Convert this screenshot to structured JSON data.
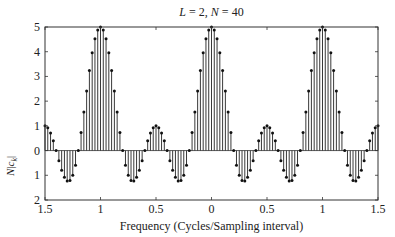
{
  "chart_data": {
    "type": "stem",
    "title": "L = 2, N = 40",
    "title_parts": {
      "L": "L",
      "L_val": "2",
      "N": "N",
      "N_val": "40"
    },
    "xlabel": "Frequency (Cycles/Sampling interval)",
    "ylabel": "N|c_k|",
    "xlim": [
      -1.5,
      1.5
    ],
    "ylim": [
      -2,
      5
    ],
    "x_tick_values": [
      -1.5,
      -1,
      -0.5,
      0,
      0.5,
      1,
      1.5
    ],
    "x_tick_labels": [
      "1.5",
      "1",
      "0.5",
      "0",
      "0.5",
      "1",
      "1.5"
    ],
    "y_tick_values": [
      5,
      4,
      3,
      2,
      1,
      0,
      -1,
      -2
    ],
    "y_tick_labels": [
      "5",
      "4",
      "3",
      "2",
      "1",
      "0",
      "1",
      "2"
    ],
    "grid": false,
    "legend": null,
    "x_step": 0.025,
    "x_start": -1.5,
    "values": [
      1.0,
      0.927,
      0.716,
      0.394,
      0,
      -0.414,
      -0.794,
      -1.084,
      -1.236,
      -1.215,
      -1.0,
      -0.589,
      0,
      0.732,
      1.558,
      2.414,
      3.236,
      3.957,
      4.52,
      4.877,
      5.0,
      4.877,
      4.52,
      3.957,
      3.236,
      2.414,
      1.558,
      0.732,
      0,
      -0.589,
      -1.0,
      -1.215,
      -1.236,
      -1.084,
      -0.794,
      -0.414,
      0,
      0.394,
      0.716,
      0.927,
      1.0,
      0.927,
      0.716,
      0.394,
      0,
      -0.414,
      -0.794,
      -1.084,
      -1.236,
      -1.215,
      -1.0,
      -0.589,
      0,
      0.732,
      1.558,
      2.414,
      3.236,
      3.957,
      4.52,
      4.877,
      5.0,
      4.877,
      4.52,
      3.957,
      3.236,
      2.414,
      1.558,
      0.732,
      0,
      -0.589,
      -1.0,
      -1.215,
      -1.236,
      -1.084,
      -0.794,
      -0.414,
      0,
      0.394,
      0.716,
      0.927,
      1.0,
      0.927,
      0.716,
      0.394,
      0,
      -0.414,
      -0.794,
      -1.084,
      -1.236,
      -1.215,
      -1.0,
      -0.589,
      0,
      0.732,
      1.558,
      2.414,
      3.236,
      3.957,
      4.52,
      4.877,
      5.0,
      4.877,
      4.52,
      3.957,
      3.236,
      2.414,
      1.558,
      0.732,
      0,
      -0.589,
      -1.0,
      -1.215,
      -1.236,
      -1.084,
      -0.794,
      -0.414,
      0,
      0.394,
      0.716,
      0.927,
      1.0
    ],
    "colors": {
      "stem": "#222222",
      "marker": "#111111",
      "axis": "#333333"
    }
  }
}
